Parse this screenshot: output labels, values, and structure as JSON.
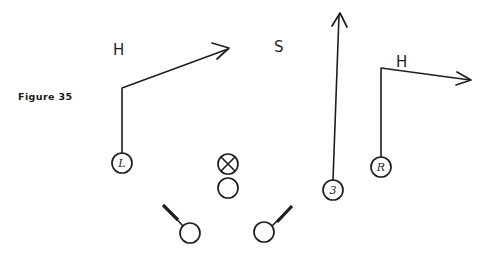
{
  "figure": {
    "caption": "Figure  35",
    "caption_x": 18,
    "caption_y": 100,
    "background_color": "#ffffff",
    "ink_color": "#1f1f1f",
    "width": 478,
    "height": 255
  },
  "field_labels": [
    {
      "id": "defender-h-left",
      "text": "H",
      "x": 113,
      "y": 55
    },
    {
      "id": "defender-s",
      "text": "S",
      "x": 274,
      "y": 52
    },
    {
      "id": "defender-h-right",
      "text": "H",
      "x": 396,
      "y": 67
    }
  ],
  "players": [
    {
      "id": "left-end",
      "label": "L",
      "cx": 122,
      "cy": 163,
      "r": 10
    },
    {
      "id": "center-ball",
      "label": "",
      "cx": 228,
      "cy": 164,
      "r": 10,
      "marker": "x-in-circle"
    },
    {
      "id": "center-back",
      "label": "",
      "cx": 228,
      "cy": 188,
      "r": 10,
      "marker": "open-circle"
    },
    {
      "id": "left-guard",
      "label": "",
      "cx": 190,
      "cy": 233,
      "r": 10,
      "marker": "open-circle-block-left"
    },
    {
      "id": "right-guard",
      "label": "",
      "cx": 264,
      "cy": 232,
      "r": 10,
      "marker": "open-circle-block-right"
    },
    {
      "id": "back-three",
      "label": "3",
      "cx": 333,
      "cy": 190,
      "r": 10
    },
    {
      "id": "right-end",
      "label": "R",
      "cx": 381,
      "cy": 167,
      "r": 10
    }
  ],
  "routes": [
    {
      "id": "route-left-end",
      "from_player": "left-end",
      "path": "M 122 153 L 122 88 L 228 49",
      "arrow": "M 212 43 L 229 48 L 217 59"
    },
    {
      "id": "route-back-three",
      "from_player": "back-three",
      "path": "M 333 180 L 339 15",
      "arrow": "M 332 26 L 340 13 L 347 27"
    },
    {
      "id": "route-right-end",
      "from_player": "right-end",
      "path": "M 381 157 L 381 68 L 470 80",
      "arrow": "M 457 72 L 471 80 L 456 85"
    }
  ],
  "blocks": [
    {
      "id": "block-left-guard",
      "stem": "M 183 226 L 171 213",
      "bar": "M 163 205 L 178 220"
    },
    {
      "id": "block-right-guard",
      "stem": "M 272 226 L 284 214",
      "bar": "M 277 222 L 292 206"
    }
  ]
}
